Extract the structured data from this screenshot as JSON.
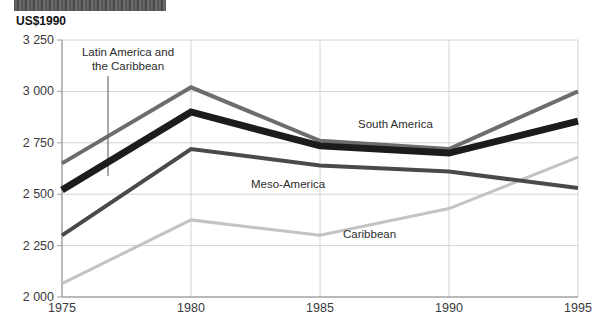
{
  "header": {
    "banner_text": ""
  },
  "unit_label": "US$1990",
  "chart_data": {
    "type": "line",
    "title": "",
    "subtitle": "",
    "xlabel": "",
    "ylabel": "US$1990",
    "x": [
      1975,
      1980,
      1985,
      1990,
      1995
    ],
    "xtick_labels": [
      "1975",
      "1980",
      "1985",
      "1990",
      "1995"
    ],
    "ytick_labels": [
      "2 000",
      "2 250",
      "2 500",
      "2 750",
      "3 000",
      "3 250"
    ],
    "ytick_values": [
      2000,
      2250,
      2500,
      2750,
      3000,
      3250
    ],
    "ylim": [
      2000,
      3250
    ],
    "xlim": [
      1975,
      1995
    ],
    "grid": true,
    "legend": "inline-annotations",
    "series": [
      {
        "name": "South America",
        "color": "#6d6d6d",
        "width": 4,
        "values": [
          2650,
          3020,
          2760,
          2720,
          3000
        ],
        "label": "South America",
        "label_x": 358,
        "label_y": 118
      },
      {
        "name": "Latin America and the Caribbean",
        "color": "#1c1c1c",
        "width": 7,
        "values": [
          2520,
          2900,
          2735,
          2700,
          2855
        ],
        "label": "Latin America and the Caribbean",
        "label_line1": "Latin America and",
        "label_line2": "the Caribbean",
        "label_x": 64,
        "label_y": 46
      },
      {
        "name": "Meso-America",
        "color": "#4a4a4a",
        "width": 4,
        "values": [
          2300,
          2720,
          2640,
          2610,
          2530
        ],
        "label": "Meso-America",
        "label_x": 251,
        "label_y": 178
      },
      {
        "name": "Caribbean",
        "color": "#c3c3c3",
        "width": 3,
        "values": [
          2065,
          2375,
          2300,
          2430,
          2680
        ],
        "label": "Caribbean",
        "label_x": 343,
        "label_y": 228
      }
    ],
    "annotations": [
      {
        "name": "lac-leader-line",
        "from_x": 108,
        "from_y": 76,
        "to_x": 108,
        "to_y": 176
      }
    ],
    "colors": {
      "grid": "#c9c9c9",
      "axis": "#8a8a8a",
      "text": "#3a3a3a",
      "background": "#ffffff"
    }
  }
}
